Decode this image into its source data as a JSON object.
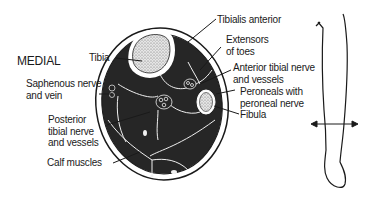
{
  "diagram": {
    "orientation_label": "MEDIAL",
    "labels": {
      "tibia": "Tibia",
      "saphenous": "Saphenous nerve\nand vein",
      "posterior_tibial": "Posterior\ntibial nerve\nand vessels",
      "calf_muscles": "Calf muscles",
      "tibialis_anterior": "Tibialis anterior",
      "extensors": "Extensors\nof toes",
      "anterior_tibial": "Anterior tibial nerve\nand vessels",
      "peroneals": "Peroneals with\nperoneal nerve",
      "fibula": "Fibula"
    },
    "colors": {
      "ink": "#1a1a1a",
      "muscle": "#262626",
      "bone": "#d9d9d9",
      "background": "#ffffff"
    }
  }
}
